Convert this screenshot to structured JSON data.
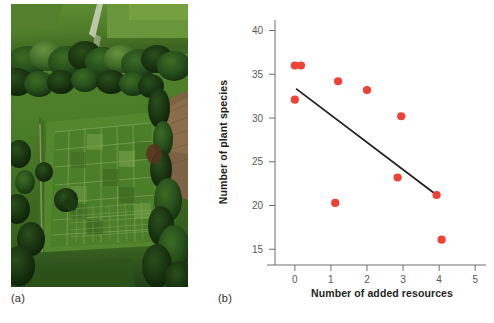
{
  "figure": {
    "panel_a": {
      "caption": "(a)",
      "image_name": "aerial-photograph-grassland-experiment-plots"
    },
    "panel_b": {
      "caption": "(b)"
    }
  },
  "chart_data": {
    "type": "scatter",
    "title": "",
    "xlabel": "Number of added resources",
    "ylabel": "Number of plant species",
    "xlim": [
      -0.55,
      5.3
    ],
    "ylim": [
      13.2,
      41.2
    ],
    "xticks": [
      0,
      1,
      2,
      3,
      4,
      5
    ],
    "xtick_labels": [
      "0",
      "1",
      "2",
      "3",
      "4",
      "5"
    ],
    "yticks": [
      15,
      20,
      25,
      30,
      35,
      40
    ],
    "ytick_labels": [
      "15",
      "20",
      "25",
      "30",
      "35",
      "40"
    ],
    "grid": false,
    "legend": null,
    "point_color": "#ef4136",
    "line_color": "#231f20",
    "points": [
      {
        "x": 0.0,
        "y": 36.0
      },
      {
        "x": 0.17,
        "y": 36.0
      },
      {
        "x": 0.0,
        "y": 32.1
      },
      {
        "x": 1.2,
        "y": 34.2
      },
      {
        "x": 1.12,
        "y": 20.3
      },
      {
        "x": 2.0,
        "y": 33.2
      },
      {
        "x": 2.85,
        "y": 23.2
      },
      {
        "x": 2.95,
        "y": 30.2
      },
      {
        "x": 3.93,
        "y": 21.2
      },
      {
        "x": 4.07,
        "y": 16.1
      }
    ],
    "trend_line": {
      "x": [
        0.05,
        3.93
      ],
      "y": [
        33.3,
        21.2
      ]
    }
  }
}
